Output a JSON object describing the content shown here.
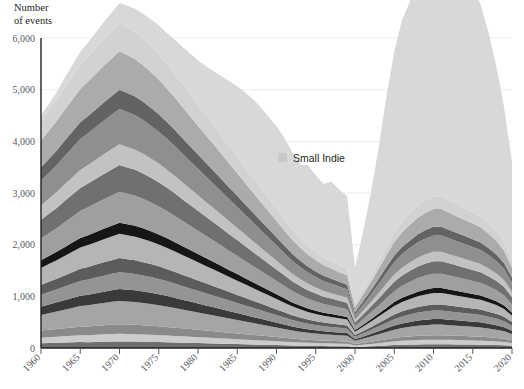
{
  "axis_title": "Number\nof events",
  "legend": {
    "swatch_color": "#c9c9c9",
    "label": "Small Indie"
  },
  "chart_data": {
    "type": "area",
    "title": "",
    "xlabel": "",
    "ylabel": "Number of events",
    "stacked": true,
    "grid": true,
    "legend_position": "inside-right",
    "xlim": [
      1960,
      2020
    ],
    "ylim": [
      0,
      6000
    ],
    "ytick_labels": [
      "0",
      "1,000",
      "2,000",
      "3,000",
      "4,000",
      "5,000",
      "6,000"
    ],
    "yticks": [
      0,
      1000,
      2000,
      3000,
      4000,
      5000,
      6000
    ],
    "xticks": [
      1960,
      1965,
      1970,
      1975,
      1980,
      1985,
      1990,
      1995,
      2000,
      2005,
      2010,
      2015,
      2020
    ],
    "xtick_labels": [
      "1960",
      "1965",
      "1970",
      "1975",
      "1980",
      "1985",
      "1990",
      "1995",
      "2000",
      "2005",
      "2010",
      "2015",
      "2020"
    ],
    "x": [
      1960,
      1961,
      1962,
      1963,
      1964,
      1965,
      1966,
      1967,
      1968,
      1969,
      1970,
      1971,
      1972,
      1973,
      1974,
      1975,
      1976,
      1977,
      1978,
      1979,
      1980,
      1981,
      1982,
      1983,
      1984,
      1985,
      1986,
      1987,
      1988,
      1989,
      1990,
      1991,
      1992,
      1993,
      1994,
      1995,
      1996,
      1997,
      1998,
      1999,
      2000,
      2001,
      2002,
      2003,
      2004,
      2005,
      2006,
      2007,
      2008,
      2009,
      2010,
      2011,
      2012,
      2013,
      2014,
      2015,
      2016,
      2017,
      2018,
      2019,
      2020
    ],
    "series": [
      {
        "name": "Layer 1",
        "color": "#6f6f6f",
        "values": [
          90,
          95,
          100,
          105,
          110,
          115,
          112,
          118,
          122,
          125,
          128,
          126,
          124,
          120,
          118,
          115,
          112,
          108,
          104,
          100,
          96,
          92,
          88,
          84,
          80,
          76,
          72,
          68,
          64,
          60,
          56,
          52,
          48,
          44,
          42,
          40,
          38,
          36,
          34,
          32,
          20,
          26,
          32,
          40,
          48,
          56,
          62,
          66,
          70,
          72,
          74,
          74,
          72,
          70,
          68,
          66,
          64,
          60,
          56,
          52,
          44
        ]
      },
      {
        "name": "Layer 2",
        "color": "#cccccc",
        "values": [
          110,
          115,
          118,
          122,
          126,
          130,
          134,
          138,
          142,
          146,
          148,
          146,
          144,
          142,
          138,
          134,
          130,
          126,
          122,
          118,
          114,
          110,
          106,
          102,
          98,
          94,
          90,
          86,
          82,
          78,
          74,
          70,
          66,
          62,
          58,
          56,
          54,
          52,
          50,
          48,
          30,
          38,
          46,
          54,
          62,
          70,
          76,
          80,
          84,
          86,
          88,
          88,
          86,
          84,
          82,
          80,
          78,
          74,
          70,
          64,
          54
        ]
      },
      {
        "name": "Layer 3",
        "color": "#8a8a8a",
        "values": [
          140,
          145,
          150,
          155,
          160,
          166,
          170,
          174,
          178,
          182,
          186,
          184,
          182,
          178,
          174,
          170,
          166,
          160,
          154,
          148,
          142,
          136,
          130,
          124,
          118,
          112,
          106,
          100,
          94,
          88,
          82,
          76,
          70,
          64,
          60,
          56,
          52,
          50,
          48,
          46,
          28,
          36,
          44,
          52,
          60,
          68,
          74,
          78,
          82,
          84,
          86,
          86,
          84,
          82,
          80,
          78,
          76,
          72,
          68,
          62,
          52
        ]
      },
      {
        "name": "Layer 4",
        "color": "#a5a5a5",
        "values": [
          300,
          320,
          340,
          360,
          380,
          400,
          410,
          420,
          430,
          440,
          450,
          445,
          440,
          430,
          420,
          410,
          395,
          380,
          365,
          350,
          335,
          320,
          305,
          290,
          275,
          260,
          245,
          230,
          215,
          200,
          185,
          170,
          155,
          145,
          135,
          128,
          122,
          118,
          114,
          110,
          60,
          80,
          100,
          120,
          140,
          160,
          175,
          185,
          195,
          200,
          205,
          205,
          200,
          195,
          190,
          185,
          180,
          170,
          160,
          145,
          120
        ]
      },
      {
        "name": "Layer 5",
        "color": "#3a3a3a",
        "values": [
          160,
          168,
          176,
          184,
          192,
          200,
          206,
          212,
          218,
          224,
          230,
          228,
          226,
          222,
          218,
          212,
          206,
          198,
          190,
          182,
          174,
          166,
          158,
          150,
          142,
          134,
          126,
          118,
          110,
          102,
          94,
          86,
          78,
          72,
          66,
          62,
          58,
          56,
          54,
          52,
          30,
          40,
          50,
          60,
          70,
          80,
          88,
          94,
          100,
          104,
          108,
          108,
          106,
          104,
          102,
          100,
          98,
          94,
          88,
          80,
          66
        ]
      },
      {
        "name": "Layer 6",
        "color": "#949494",
        "values": [
          230,
          240,
          250,
          262,
          274,
          286,
          294,
          302,
          310,
          318,
          326,
          322,
          318,
          312,
          304,
          296,
          286,
          276,
          266,
          256,
          246,
          236,
          226,
          216,
          206,
          196,
          186,
          176,
          166,
          156,
          146,
          136,
          126,
          118,
          110,
          104,
          98,
          94,
          90,
          86,
          48,
          62,
          76,
          92,
          108,
          124,
          136,
          146,
          154,
          160,
          164,
          164,
          160,
          156,
          152,
          148,
          144,
          136,
          128,
          116,
          96
        ]
      },
      {
        "name": "Layer 7",
        "color": "#5c5c5c",
        "values": [
          190,
          198,
          206,
          216,
          226,
          236,
          244,
          250,
          258,
          264,
          272,
          268,
          264,
          258,
          252,
          244,
          236,
          228,
          218,
          210,
          200,
          192,
          182,
          174,
          164,
          156,
          146,
          138,
          128,
          120,
          110,
          102,
          92,
          86,
          80,
          74,
          70,
          68,
          64,
          62,
          34,
          44,
          56,
          66,
          78,
          90,
          98,
          104,
          110,
          116,
          118,
          118,
          116,
          112,
          110,
          106,
          104,
          98,
          92,
          84,
          70
        ]
      },
      {
        "name": "Layer 8",
        "color": "#b5b5b5",
        "values": [
          330,
          345,
          360,
          378,
          394,
          410,
          422,
          434,
          446,
          458,
          470,
          464,
          456,
          448,
          436,
          424,
          410,
          396,
          382,
          366,
          352,
          336,
          322,
          306,
          292,
          276,
          262,
          246,
          232,
          216,
          202,
          186,
          172,
          160,
          148,
          140,
          132,
          126,
          122,
          116,
          64,
          84,
          104,
          124,
          146,
          166,
          182,
          194,
          206,
          214,
          220,
          220,
          214,
          208,
          202,
          196,
          190,
          180,
          168,
          152,
          126
        ]
      },
      {
        "name": "Layer 9",
        "color": "#161616",
        "values": [
          150,
          156,
          162,
          170,
          178,
          186,
          192,
          198,
          204,
          210,
          216,
          212,
          210,
          206,
          200,
          194,
          188,
          182,
          174,
          168,
          160,
          154,
          146,
          140,
          132,
          126,
          118,
          112,
          104,
          98,
          90,
          84,
          76,
          70,
          66,
          62,
          58,
          56,
          52,
          50,
          28,
          36,
          46,
          54,
          64,
          74,
          80,
          86,
          90,
          94,
          96,
          96,
          94,
          92,
          90,
          86,
          84,
          80,
          74,
          68,
          56
        ]
      },
      {
        "name": "Layer 10",
        "color": "#9f9f9f",
        "values": [
          420,
          438,
          458,
          480,
          502,
          522,
          538,
          554,
          570,
          586,
          600,
          592,
          584,
          572,
          558,
          542,
          526,
          508,
          488,
          470,
          450,
          430,
          412,
          392,
          372,
          354,
          334,
          314,
          296,
          276,
          258,
          238,
          220,
          204,
          190,
          178,
          168,
          162,
          154,
          148,
          82,
          106,
          132,
          158,
          186,
          212,
          232,
          248,
          262,
          272,
          280,
          280,
          272,
          264,
          258,
          250,
          242,
          230,
          214,
          194,
          160
        ]
      },
      {
        "name": "Layer 11",
        "color": "#707070",
        "values": [
          360,
          376,
          392,
          412,
          430,
          448,
          462,
          476,
          490,
          502,
          516,
          508,
          500,
          490,
          478,
          466,
          450,
          436,
          418,
          402,
          386,
          370,
          354,
          338,
          320,
          304,
          288,
          270,
          254,
          238,
          222,
          206,
          190,
          176,
          164,
          154,
          144,
          138,
          132,
          126,
          70,
          92,
          112,
          136,
          160,
          182,
          200,
          212,
          224,
          234,
          240,
          240,
          234,
          228,
          220,
          214,
          208,
          196,
          184,
          166,
          138
        ]
      },
      {
        "name": "Layer 12",
        "color": "#c2c2c2",
        "values": [
          280,
          292,
          306,
          320,
          334,
          348,
          360,
          370,
          382,
          392,
          402,
          396,
          390,
          382,
          372,
          362,
          350,
          338,
          326,
          312,
          300,
          286,
          274,
          262,
          248,
          236,
          222,
          210,
          196,
          184,
          172,
          158,
          146,
          136,
          126,
          118,
          110,
          106,
          100,
          96,
          54,
          70,
          86,
          104,
          122,
          140,
          152,
          162,
          172,
          178,
          184,
          184,
          178,
          174,
          168,
          164,
          158,
          150,
          140,
          126,
          104
        ]
      },
      {
        "name": "Layer 13",
        "color": "#8f8f8f",
        "values": [
          480,
          500,
          522,
          548,
          572,
          596,
          614,
          632,
          650,
          668,
          684,
          676,
          666,
          652,
          636,
          618,
          598,
          578,
          556,
          534,
          512,
          490,
          470,
          448,
          426,
          404,
          382,
          360,
          338,
          316,
          294,
          272,
          250,
          232,
          216,
          202,
          190,
          182,
          174,
          166,
          92,
          120,
          148,
          180,
          210,
          240,
          262,
          280,
          296,
          306,
          316,
          316,
          306,
          298,
          290,
          282,
          272,
          258,
          242,
          218,
          180
        ]
      },
      {
        "name": "Layer 14",
        "color": "#636363",
        "values": [
          260,
          272,
          284,
          298,
          312,
          324,
          334,
          344,
          354,
          364,
          372,
          368,
          362,
          354,
          346,
          336,
          326,
          314,
          302,
          290,
          278,
          266,
          254,
          242,
          230,
          218,
          206,
          194,
          182,
          170,
          158,
          146,
          134,
          124,
          116,
          108,
          102,
          98,
          92,
          88,
          48,
          64,
          78,
          94,
          112,
          128,
          140,
          148,
          158,
          164,
          168,
          168,
          164,
          158,
          154,
          150,
          144,
          136,
          128,
          114,
          96
        ]
      },
      {
        "name": "Layer 15",
        "color": "#ababab",
        "values": [
          520,
          544,
          568,
          596,
          622,
          648,
          668,
          688,
          708,
          726,
          744,
          734,
          724,
          708,
          690,
          672,
          650,
          628,
          604,
          580,
          556,
          532,
          510,
          486,
          462,
          438,
          414,
          390,
          366,
          342,
          318,
          294,
          272,
          252,
          234,
          220,
          206,
          198,
          188,
          180,
          100,
          130,
          160,
          194,
          228,
          260,
          284,
          304,
          320,
          332,
          342,
          342,
          332,
          322,
          312,
          304,
          294,
          280,
          262,
          236,
          196
        ]
      },
      {
        "name": "Layer 16",
        "color": "#d2d2d2",
        "values": [
          380,
          396,
          414,
          434,
          454,
          472,
          486,
          500,
          516,
          530,
          542,
          534,
          526,
          516,
          502,
          490,
          474,
          458,
          440,
          422,
          406,
          388,
          372,
          354,
          336,
          320,
          302,
          284,
          266,
          250,
          232,
          214,
          198,
          184,
          170,
          160,
          150,
          144,
          136,
          130,
          72,
          94,
          116,
          140,
          166,
          190,
          206,
          220,
          234,
          242,
          248,
          248,
          242,
          234,
          228,
          220,
          214,
          202,
          190,
          172,
          142
        ]
      },
      {
        "name": "Small Indie",
        "color": "#d8d8d8",
        "values": [
          100,
          120,
          150,
          180,
          210,
          240,
          270,
          300,
          330,
          360,
          390,
          420,
          450,
          480,
          520,
          560,
          600,
          660,
          720,
          790,
          860,
          950,
          1050,
          1150,
          1260,
          1360,
          1450,
          1520,
          1560,
          1580,
          1600,
          1580,
          1500,
          1420,
          1560,
          1480,
          1420,
          1540,
          1460,
          1400,
          700,
          1100,
          1600,
          2200,
          2900,
          3500,
          3900,
          4100,
          4400,
          4200,
          3900,
          4100,
          4300,
          4450,
          4300,
          4350,
          4100,
          3700,
          3200,
          2600,
          1900
        ]
      }
    ]
  }
}
